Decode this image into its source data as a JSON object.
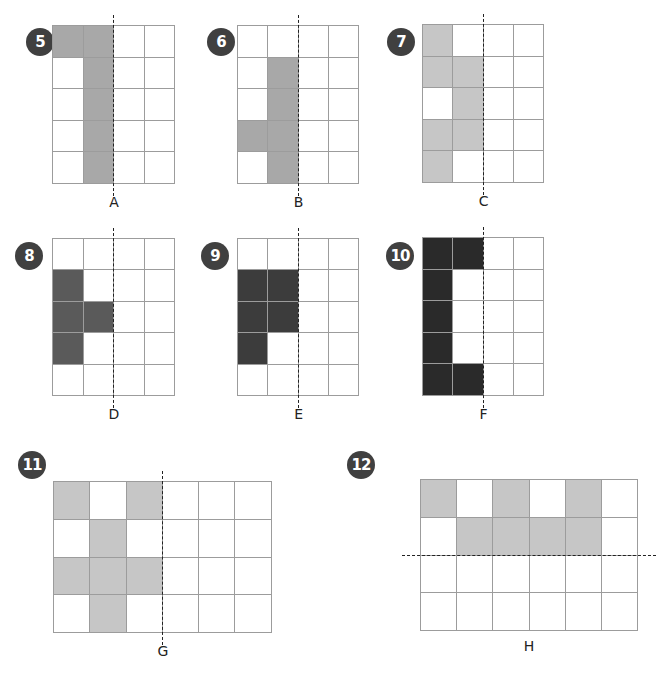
{
  "colors": {
    "medium_gray": "#a8a8a8",
    "light_gray": "#c6c6c6",
    "dark_gray": "#5a5a5a",
    "darker_gray": "#3c3c3c",
    "black": "#2a2a2a",
    "grid_line": "#9c9c9c",
    "badge": "#404040"
  },
  "puzzles": [
    {
      "number": "5",
      "label": "A",
      "cols": 4,
      "rows": 5,
      "fill": "#a8a8a8",
      "line": "vertical",
      "line_after": 2,
      "filled": [
        [
          0,
          0
        ],
        [
          0,
          1
        ],
        [
          1,
          1
        ],
        [
          2,
          1
        ],
        [
          3,
          1
        ],
        [
          4,
          1
        ]
      ],
      "pos": {
        "x": 52,
        "y": 25,
        "cw": 30.5,
        "ch": 31.6
      },
      "badge": {
        "x": 26,
        "y": 28
      }
    },
    {
      "number": "6",
      "label": "B",
      "cols": 4,
      "rows": 5,
      "fill": "#a8a8a8",
      "line": "vertical",
      "line_after": 2,
      "filled": [
        [
          1,
          1
        ],
        [
          2,
          1
        ],
        [
          3,
          0
        ],
        [
          3,
          1
        ],
        [
          4,
          1
        ]
      ],
      "pos": {
        "x": 237,
        "y": 25,
        "cw": 30.3,
        "ch": 31.6
      },
      "badge": {
        "x": 207,
        "y": 28
      }
    },
    {
      "number": "7",
      "label": "C",
      "cols": 4,
      "rows": 5,
      "fill": "#c6c6c6",
      "line": "vertical",
      "line_after": 2,
      "filled": [
        [
          0,
          0
        ],
        [
          1,
          0
        ],
        [
          1,
          1
        ],
        [
          2,
          1
        ],
        [
          3,
          0
        ],
        [
          3,
          1
        ],
        [
          4,
          0
        ]
      ],
      "pos": {
        "x": 422,
        "y": 24,
        "cw": 30.3,
        "ch": 31.6
      },
      "badge": {
        "x": 387,
        "y": 28
      }
    },
    {
      "number": "8",
      "label": "D",
      "cols": 4,
      "rows": 5,
      "fill": "#5a5a5a",
      "line": "vertical",
      "line_after": 2,
      "filled": [
        [
          1,
          0
        ],
        [
          2,
          0
        ],
        [
          2,
          1
        ],
        [
          3,
          0
        ]
      ],
      "pos": {
        "x": 52,
        "y": 238,
        "cw": 30.5,
        "ch": 31.4
      },
      "badge": {
        "x": 15,
        "y": 242
      }
    },
    {
      "number": "9",
      "label": "E",
      "cols": 4,
      "rows": 5,
      "fill": "#3c3c3c",
      "line": "vertical",
      "line_after": 2,
      "filled": [
        [
          1,
          0
        ],
        [
          1,
          1
        ],
        [
          2,
          0
        ],
        [
          2,
          1
        ],
        [
          3,
          0
        ]
      ],
      "pos": {
        "x": 237,
        "y": 238,
        "cw": 30.3,
        "ch": 31.4
      },
      "badge": {
        "x": 201,
        "y": 242
      }
    },
    {
      "number": "10",
      "label": "F",
      "cols": 4,
      "rows": 5,
      "fill": "#2a2a2a",
      "line": "vertical",
      "line_after": 2,
      "filled": [
        [
          0,
          0
        ],
        [
          0,
          1
        ],
        [
          1,
          0
        ],
        [
          2,
          0
        ],
        [
          3,
          0
        ],
        [
          4,
          0
        ],
        [
          4,
          1
        ]
      ],
      "pos": {
        "x": 422,
        "y": 237,
        "cw": 30.3,
        "ch": 31.6
      },
      "badge": {
        "x": 386,
        "y": 242
      }
    },
    {
      "number": "11",
      "label": "G",
      "cols": 6,
      "rows": 4,
      "fill": "#c6c6c6",
      "line": "vertical",
      "line_after": 3,
      "filled": [
        [
          0,
          0
        ],
        [
          0,
          2
        ],
        [
          1,
          1
        ],
        [
          2,
          0
        ],
        [
          2,
          1
        ],
        [
          2,
          2
        ],
        [
          3,
          1
        ]
      ],
      "pos": {
        "x": 53,
        "y": 481,
        "cw": 36.3,
        "ch": 37.8
      },
      "badge": {
        "x": 18,
        "y": 451
      }
    },
    {
      "number": "12",
      "label": "H",
      "cols": 6,
      "rows": 4,
      "fill": "#c6c6c6",
      "line": "horizontal",
      "line_after": 2,
      "filled": [
        [
          0,
          0
        ],
        [
          0,
          2
        ],
        [
          0,
          4
        ],
        [
          1,
          1
        ],
        [
          1,
          2
        ],
        [
          1,
          3
        ],
        [
          1,
          4
        ]
      ],
      "pos": {
        "x": 420,
        "y": 479,
        "cw": 36.2,
        "ch": 37.8
      },
      "badge": {
        "x": 347,
        "y": 451
      }
    }
  ]
}
